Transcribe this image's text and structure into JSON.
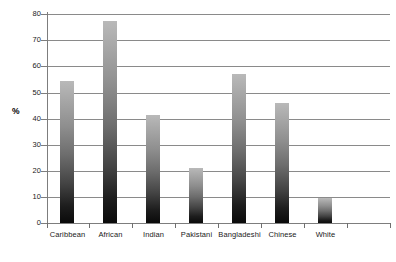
{
  "chart_data": {
    "type": "bar",
    "title": "",
    "subtitle": "",
    "xlabel": "",
    "ylabel": "%",
    "ylim": [
      0,
      80
    ],
    "ytick_step": 10,
    "yticks": [
      0,
      10,
      20,
      30,
      40,
      50,
      60,
      70,
      80
    ],
    "ytick_labels": [
      "0",
      "10",
      "20",
      "30",
      "40",
      "50",
      "60",
      "70",
      "80"
    ],
    "grid": true,
    "grid_axis": "y",
    "legend": false,
    "legend_position": "none",
    "categories": [
      "Caribbean",
      "African",
      "Indian",
      "Pakistani",
      "Bangladeshi",
      "Chinese",
      "White"
    ],
    "values": [
      54.5,
      77.3,
      41.5,
      21.0,
      57.0,
      46.0,
      9.7
    ],
    "series": [
      {
        "name": "",
        "values": [
          54.5,
          77.3,
          41.5,
          21.0,
          57.0,
          46.0,
          9.7
        ]
      }
    ],
    "bar_fill": "vertical-gradient-gray",
    "bar_color_top": "#b9b9b9",
    "bar_color_bottom": "#0a0a0a",
    "axis_color": "#7d7d7d",
    "gridline_color": "#8a8a8a",
    "background": "#ffffff"
  }
}
